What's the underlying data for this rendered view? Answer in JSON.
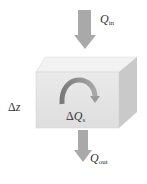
{
  "diagram": {
    "title": "",
    "labels": {
      "q_in": {
        "symbol": "Q",
        "subscript": "in"
      },
      "q_out": {
        "symbol": "Q",
        "subscript": "out"
      },
      "delta_z": {
        "delta": "Δ",
        "symbol": "z"
      },
      "delta_qs": {
        "delta": "Δ",
        "symbol": "Q",
        "subscript": "s"
      }
    },
    "colors": {
      "arrow": "#a9a9a9",
      "box_front": "#e4e4e4",
      "box_top": "#f2f2f2",
      "box_side": "#cccccc",
      "curved_arrow": "#8a8a8a",
      "text": "#333333"
    },
    "elements": [
      {
        "type": "arrow",
        "direction": "down",
        "role": "inflow",
        "label": "Q_in"
      },
      {
        "type": "box",
        "role": "control-volume",
        "height_label": "Δz"
      },
      {
        "type": "curved-arrow",
        "role": "storage-change",
        "label": "ΔQ_s"
      },
      {
        "type": "arrow",
        "direction": "down",
        "role": "outflow",
        "label": "Q_out"
      }
    ]
  }
}
